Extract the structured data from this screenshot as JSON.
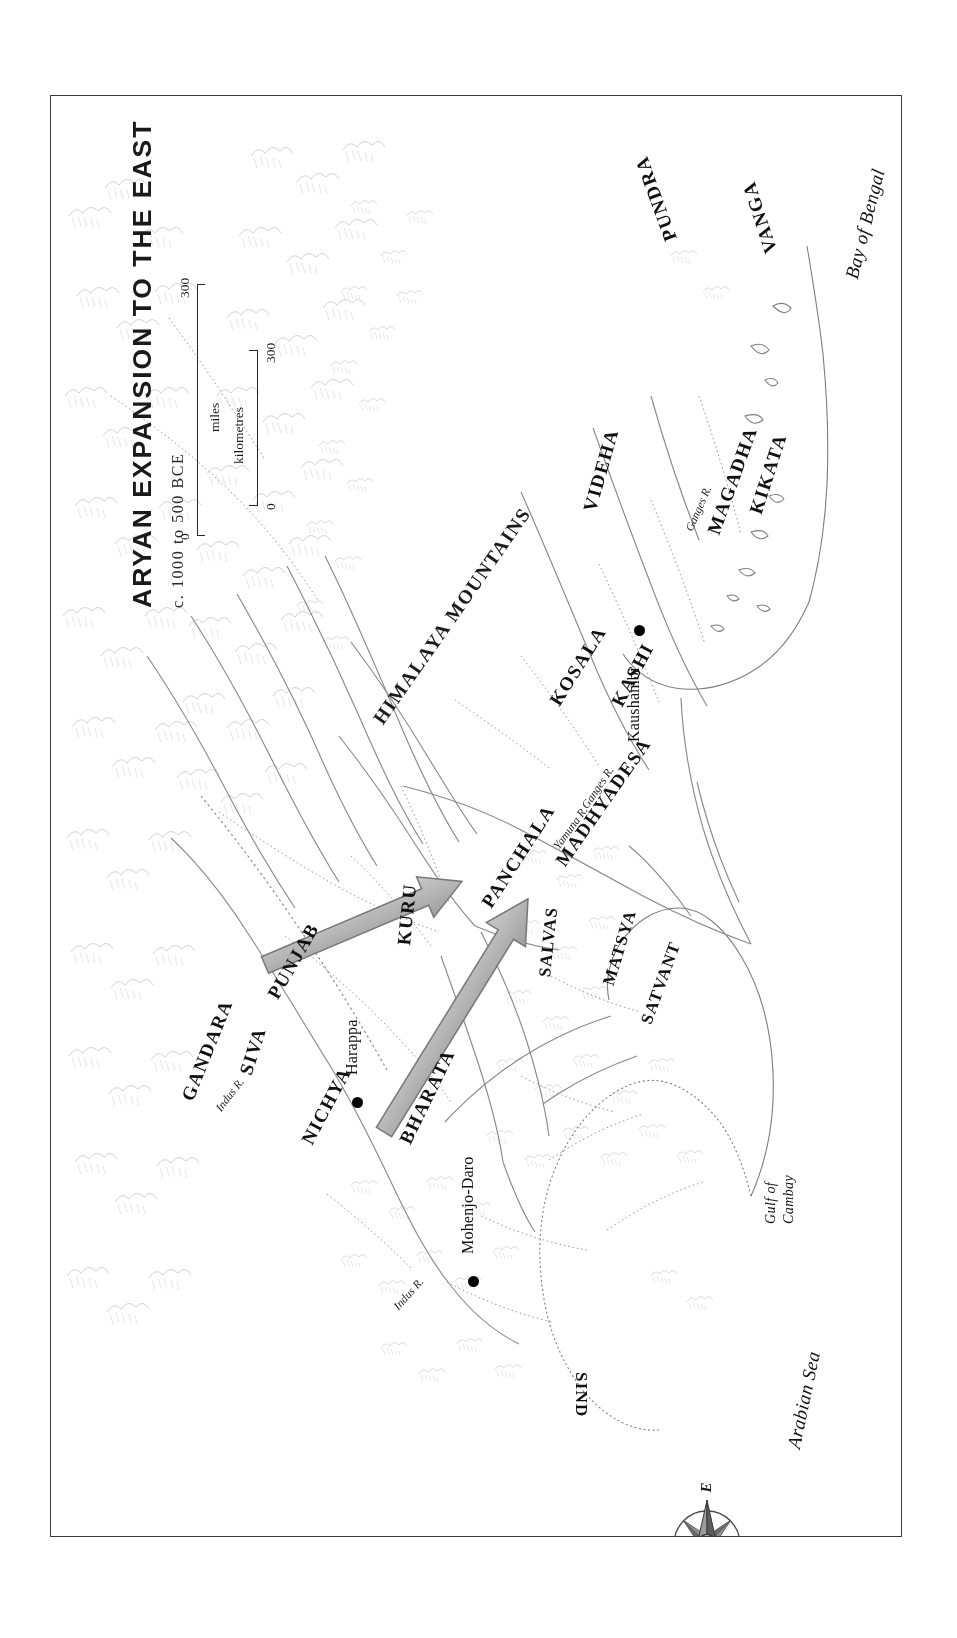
{
  "title": {
    "main": "ARYAN EXPANSION TO THE EAST",
    "subtitle": "c. 1000 to 500 BCE"
  },
  "scale": {
    "miles": {
      "unit": "miles",
      "min": "0",
      "max": "300"
    },
    "kilometres": {
      "unit": "kilometres",
      "min": "0",
      "max": "300"
    }
  },
  "compass": {
    "north": "N",
    "east": "E",
    "south": "S",
    "west": "W"
  },
  "regions": [
    {
      "name": "GANDARA"
    },
    {
      "name": "SIVA"
    },
    {
      "name": "NICHYA"
    },
    {
      "name": "PUNJAB"
    },
    {
      "name": "BHARATA"
    },
    {
      "name": "KURU"
    },
    {
      "name": "PANCHALA"
    },
    {
      "name": "MADHYADESA"
    },
    {
      "name": "KOSALA"
    },
    {
      "name": "KASHI"
    },
    {
      "name": "VIDEHA"
    },
    {
      "name": "MAGADHA"
    },
    {
      "name": "KIKATA"
    },
    {
      "name": "PUNDRA"
    },
    {
      "name": "VANGA"
    },
    {
      "name": "SALVAS"
    },
    {
      "name": "MATSYA"
    },
    {
      "name": "SATVANT"
    },
    {
      "name": "SIND"
    },
    {
      "name": "HIMALAYA MOUNTAINS"
    }
  ],
  "cities": [
    {
      "name": "Mohenjo-Daro"
    },
    {
      "name": "Harappa"
    },
    {
      "name": "Kaushambi"
    }
  ],
  "rivers": [
    {
      "name": "Indus R."
    },
    {
      "name": "Indus R."
    },
    {
      "name": "Ganges R."
    },
    {
      "name": "Ganges R."
    },
    {
      "name": "Yamuna R."
    }
  ],
  "water_bodies": [
    {
      "name": "Arabian Sea"
    },
    {
      "name": "Bay of Bengal"
    },
    {
      "name": "Gulf of\nCambay"
    }
  ],
  "water_labels": {
    "arabian_sea": "Arabian Sea",
    "bay_of_bengal": "Bay of Bengal",
    "gulf_of_cambay_line1": "Gulf of",
    "gulf_of_cambay_line2": "Cambay"
  },
  "migration_arrows": [
    {
      "label": "northern-route"
    },
    {
      "label": "southern-route"
    }
  ],
  "colors": {
    "arrow_fill": "#b7b7b7",
    "arrow_stroke": "#6e6e6e",
    "frame": "#3b3b3b",
    "text": "#111111",
    "coastline": "#8b8b8b",
    "relief": "#d8d8d8"
  }
}
